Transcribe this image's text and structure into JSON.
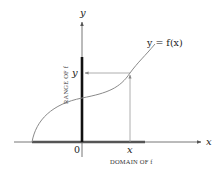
{
  "diagram": {
    "labels": {
      "y_axis": "y",
      "x_axis": "x",
      "function": "y = f(x)",
      "y_value": "y",
      "x_value": "x",
      "origin": "0",
      "range": "RANGE OF f",
      "domain": "DOMAIN OF f"
    },
    "colors": {
      "axis": "#555555",
      "curve": "#8a8a8a",
      "range_bar": "#111111",
      "domain_bar": "#555555",
      "guide_lines": "#9a9a9a",
      "text": "#222222"
    }
  }
}
